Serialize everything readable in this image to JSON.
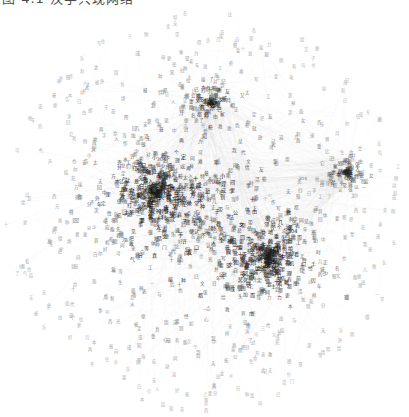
{
  "figure": {
    "title_partial": "图 4.1  汉字共现网络",
    "background_color": "#ffffff",
    "width": 409,
    "height": 417
  },
  "chart_data": {
    "type": "scatter",
    "subtype": "force-directed-network-graph",
    "title": "图 4.1  汉字共现网络",
    "xlabel": "",
    "ylabel": "",
    "xlim": [
      0,
      409
    ],
    "ylim": [
      0,
      410
    ],
    "grid": false,
    "legend": null,
    "axes_visible": false,
    "node_label_script": "CJK",
    "node_glyph_size_px": 4.5,
    "node_count_approx": 1150,
    "edge_count_approx": 4200,
    "edge_color": "#b9b9b9",
    "node_color_core": "#2e2e2e",
    "node_color_periphery": "#b0b0b0",
    "clusters": [
      {
        "name": "cluster-left-core",
        "cx": 155,
        "cy": 185,
        "radius": 78,
        "density": 1.0
      },
      {
        "name": "cluster-right-core",
        "cx": 268,
        "cy": 250,
        "radius": 72,
        "density": 0.95
      },
      {
        "name": "cluster-upper-hub",
        "cx": 212,
        "cy": 95,
        "radius": 34,
        "density": 0.55
      },
      {
        "name": "cluster-right-spur",
        "cx": 345,
        "cy": 165,
        "radius": 26,
        "density": 0.5
      },
      {
        "name": "halo-periphery",
        "cx": 205,
        "cy": 205,
        "radius": 200,
        "density": 0.12
      }
    ],
    "glyphs": [
      "的",
      "一",
      "是",
      "了",
      "我",
      "不",
      "人",
      "在",
      "他",
      "有",
      "这",
      "个",
      "上",
      "们",
      "来",
      "到",
      "时",
      "大",
      "地",
      "为",
      "子",
      "中",
      "你",
      "说",
      "生",
      "国",
      "年",
      "着",
      "就",
      "那",
      "和",
      "要",
      "她",
      "出",
      "也",
      "得",
      "里",
      "后",
      "自",
      "以",
      "会",
      "家",
      "可",
      "下",
      "而",
      "过",
      "天",
      "去",
      "能",
      "对",
      "小",
      "多",
      "然",
      "于",
      "心",
      "学",
      "么",
      "之",
      "都",
      "好",
      "看",
      "起",
      "发",
      "当",
      "没",
      "成",
      "只",
      "如",
      "事",
      "把",
      "还",
      "用",
      "第",
      "样",
      "道",
      "想",
      "作",
      "种",
      "开",
      "美",
      "总",
      "从",
      "无",
      "情",
      "己",
      "面",
      "最",
      "女",
      "但",
      "现",
      "前",
      "些",
      "所",
      "同",
      "日",
      "手",
      "又",
      "行",
      "意",
      "动",
      "方",
      "期",
      "它",
      "头",
      "经",
      "长",
      "儿",
      "回",
      "位",
      "分",
      "爱",
      "老",
      "因",
      "很",
      "给",
      "名",
      "法",
      "间",
      "斯",
      "知",
      "世",
      "什",
      "两",
      "次",
      "使",
      "身",
      "者",
      "被",
      "高",
      "已",
      "亲",
      "其",
      "进",
      "此",
      "话",
      "常",
      "与",
      "活",
      "正",
      "感",
      "见",
      "明",
      "问",
      "力",
      "理",
      "尔",
      "点",
      "文",
      "几",
      "定",
      "本",
      "公",
      "特",
      "做",
      "外",
      "孩",
      "相",
      "西",
      "果",
      "走",
      "将",
      "月",
      "十",
      "实",
      "向",
      "声",
      "车",
      "全",
      "信",
      "重",
      "三",
      "机",
      "工",
      "物",
      "气",
      "每",
      "并",
      "别",
      "真",
      "打",
      "太",
      "新",
      "比",
      "才",
      "便",
      "夫",
      "再",
      "书",
      "部",
      "水",
      "像",
      "眼",
      "等",
      "体",
      "却",
      "加",
      "电",
      "主",
      "界",
      "门",
      "利",
      "海",
      "受",
      "听",
      "表",
      "德",
      "少",
      "克",
      "代",
      "员",
      "许",
      "稍",
      "先",
      "口",
      "由",
      "死",
      "安",
      "写",
      "性",
      "马",
      "光",
      "白",
      "或",
      "住",
      "难",
      "望",
      "教",
      "命",
      "花",
      "结",
      "乐",
      "色",
      "更",
      "拉",
      "东",
      "神",
      "记",
      "处",
      "让",
      "母",
      "父",
      "应",
      "直",
      "字",
      "场",
      "平",
      "报",
      "友",
      "关",
      "放",
      "至",
      "张",
      "认",
      "接",
      "告",
      "入",
      "妻",
      "304",
      "满",
      "带",
      "毛",
      "支",
      "城",
      "速",
      "城"
    ]
  }
}
